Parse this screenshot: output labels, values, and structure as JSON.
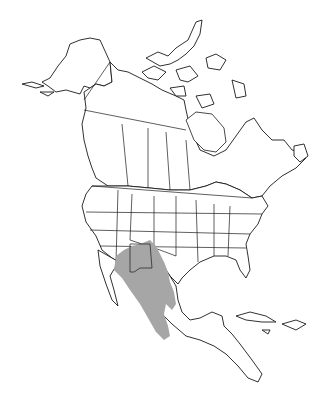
{
  "map": {
    "region": "North America",
    "style": "outline map with state and province borders",
    "range_color": "#a6a6a6",
    "outline_color": "#1a1a1a",
    "background_color": "#ffffff",
    "highlighted_range": "Southwestern United States (New Mexico, Arizona, West Texas) and northern-central Mexico along the Sierra Madre"
  }
}
